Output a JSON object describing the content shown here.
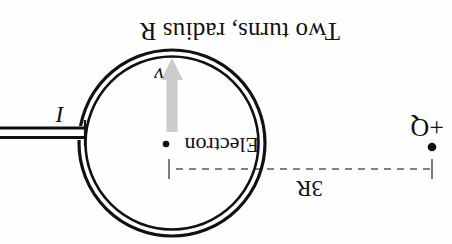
{
  "figure": {
    "background_color": "#fefefe",
    "ink_color": "#111111",
    "arrow_color": "#c9c9c9",
    "width": 452,
    "height": 244,
    "orientation": "rotated-180"
  },
  "labels": {
    "caption": "Two turns, radius R",
    "distance": "3R",
    "electron": "Electron",
    "charge": "+Q",
    "current": "I",
    "velocity": "v"
  },
  "geometry": {
    "loop": {
      "center_x": 280,
      "center_y": 101,
      "outer_radius": 93,
      "inner_radius": 87,
      "turns": 2,
      "stroke_width": 3
    },
    "electron_dot": {
      "x": 286,
      "y": 100,
      "r": 3.2
    },
    "charge_dot": {
      "x": 20,
      "y": 97,
      "r": 4.2
    },
    "dimension_line": {
      "y": 75,
      "x_start": 20,
      "x_end": 283,
      "tick_height": 20,
      "dash": "7 6"
    },
    "velocity_arrow": {
      "x": 280,
      "y_start": 112,
      "y_end": 182,
      "head_width": 20,
      "head_length": 22
    },
    "leads": {
      "x_start": 368,
      "x_end": 452,
      "y_top": 106,
      "y_bottom": 116
    }
  }
}
